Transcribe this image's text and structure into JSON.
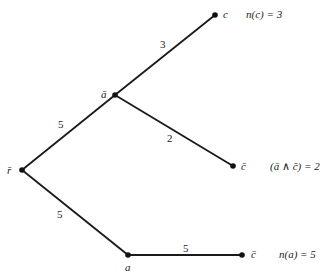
{
  "diagram": {
    "type": "tree",
    "nodes": [
      {
        "id": "r_bar",
        "label": "r̄",
        "x": 22,
        "y": 170
      },
      {
        "id": "a_bar",
        "label": "ā",
        "x": 115,
        "y": 95
      },
      {
        "id": "c",
        "label": "c",
        "x": 215,
        "y": 15
      },
      {
        "id": "c_bar_mid",
        "label": "c̄",
        "x": 233,
        "y": 166
      },
      {
        "id": "a",
        "label": "a",
        "x": 128,
        "y": 255
      },
      {
        "id": "c_bar_bot",
        "label": "c̄",
        "x": 242,
        "y": 255
      }
    ],
    "edges": [
      {
        "from": "r_bar",
        "to": "a_bar",
        "weight": "5"
      },
      {
        "from": "a_bar",
        "to": "c",
        "weight": "3"
      },
      {
        "from": "a_bar",
        "to": "c_bar_mid",
        "weight": "2"
      },
      {
        "from": "r_bar",
        "to": "a",
        "weight": "5"
      },
      {
        "from": "a",
        "to": "c_bar_bot",
        "weight": "5"
      }
    ],
    "annotations": {
      "top": "n(c) = 3",
      "middle": "(ā ∧ c̄) = 2",
      "bottom": "n(a) = 5"
    }
  }
}
